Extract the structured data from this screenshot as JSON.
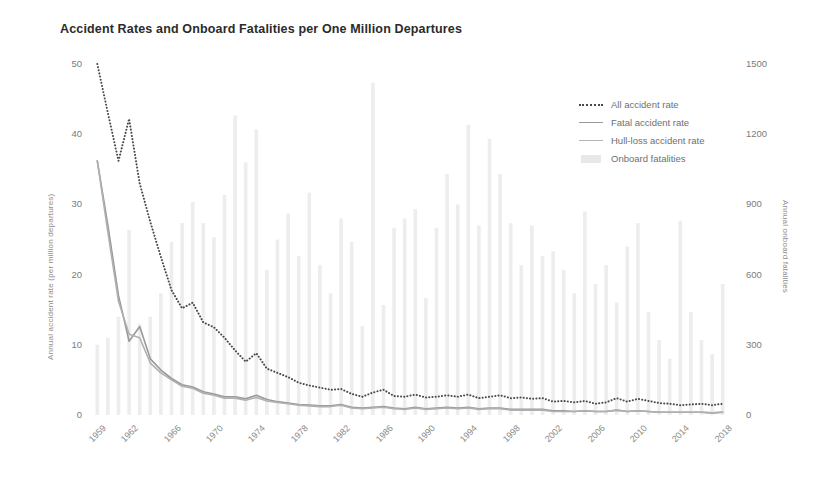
{
  "chart_data": {
    "type": "line",
    "title": "Accident Rates and Onboard Fatalities per One Million Departures",
    "xlabel": "",
    "ylabel": "Annual accident rate (per million departures)",
    "y2label": "Annual onboard fatalities",
    "ylim": [
      0,
      50
    ],
    "y2lim": [
      0,
      1500
    ],
    "yticks": [
      "0",
      "10",
      "20",
      "30",
      "40",
      "50"
    ],
    "ytick_values": [
      0,
      10,
      20,
      30,
      40,
      50
    ],
    "y2ticks": [
      "0",
      "300",
      "600",
      "900",
      "1200",
      "1500"
    ],
    "y2tick_values": [
      0,
      300,
      600,
      900,
      1200,
      1500
    ],
    "grid": false,
    "legend_position": "upper right",
    "xtick_labels": [
      "1959",
      "1962",
      "1966",
      "1970",
      "1974",
      "1978",
      "1982",
      "1986",
      "1990",
      "1994",
      "1998",
      "2002",
      "2006",
      "2010",
      "2014",
      "2018"
    ],
    "xtick_values": [
      1959,
      1962,
      1966,
      1970,
      1974,
      1978,
      1982,
      1986,
      1990,
      1994,
      1998,
      2002,
      2006,
      2010,
      2014,
      2018
    ],
    "x": [
      1959,
      1960,
      1961,
      1962,
      1963,
      1964,
      1965,
      1966,
      1967,
      1968,
      1969,
      1970,
      1971,
      1972,
      1973,
      1974,
      1975,
      1976,
      1977,
      1978,
      1979,
      1980,
      1981,
      1982,
      1983,
      1984,
      1985,
      1986,
      1987,
      1988,
      1989,
      1990,
      1991,
      1992,
      1993,
      1994,
      1995,
      1996,
      1997,
      1998,
      1999,
      2000,
      2001,
      2002,
      2003,
      2004,
      2005,
      2006,
      2007,
      2008,
      2009,
      2010,
      2011,
      2012,
      2013,
      2014,
      2015,
      2016,
      2017,
      2018
    ],
    "series": [
      {
        "name": "All accident rate",
        "axis": "left",
        "style": "dotted",
        "color": "#4a4a4a",
        "values": [
          50.0,
          43.0,
          36.2,
          42.2,
          33.0,
          27.5,
          22.5,
          17.8,
          15.2,
          16.0,
          13.2,
          12.5,
          11.0,
          9.2,
          7.6,
          8.8,
          6.6,
          6.0,
          5.4,
          4.6,
          4.2,
          3.9,
          3.6,
          3.7,
          3.0,
          2.6,
          3.2,
          3.6,
          2.7,
          2.6,
          2.9,
          2.5,
          2.6,
          2.8,
          2.6,
          2.9,
          2.4,
          2.6,
          2.8,
          2.4,
          2.5,
          2.3,
          2.4,
          1.9,
          2.0,
          1.8,
          2.0,
          1.6,
          1.8,
          2.4,
          1.9,
          2.3,
          2.0,
          1.7,
          1.6,
          1.4,
          1.5,
          1.6,
          1.4,
          1.6
        ]
      },
      {
        "name": "Fatal accident rate",
        "axis": "left",
        "style": "solid",
        "color": "#999999",
        "values": [
          36.2,
          27.0,
          17.0,
          10.5,
          12.6,
          8.0,
          6.4,
          5.2,
          4.3,
          4.0,
          3.3,
          3.0,
          2.6,
          2.6,
          2.3,
          2.8,
          2.2,
          1.9,
          1.7,
          1.5,
          1.4,
          1.3,
          1.3,
          1.5,
          1.1,
          1.0,
          1.1,
          1.2,
          1.0,
          0.9,
          1.1,
          0.9,
          1.0,
          1.1,
          1.0,
          1.1,
          0.9,
          1.0,
          1.0,
          0.8,
          0.8,
          0.8,
          0.8,
          0.6,
          0.6,
          0.5,
          0.6,
          0.5,
          0.5,
          0.7,
          0.5,
          0.6,
          0.5,
          0.4,
          0.4,
          0.4,
          0.4,
          0.4,
          0.3,
          0.4
        ]
      },
      {
        "name": "Hull-loss accident rate",
        "axis": "left",
        "style": "solid",
        "color": "#b0b0b0",
        "values": [
          36.2,
          26.0,
          16.2,
          11.5,
          11.0,
          7.4,
          6.0,
          5.0,
          4.1,
          3.8,
          3.1,
          2.8,
          2.4,
          2.4,
          2.1,
          2.5,
          2.0,
          1.8,
          1.6,
          1.4,
          1.3,
          1.2,
          1.2,
          1.4,
          1.0,
          0.9,
          1.0,
          1.1,
          0.9,
          0.8,
          1.0,
          0.8,
          0.9,
          1.0,
          0.9,
          1.0,
          0.8,
          0.9,
          0.9,
          0.7,
          0.7,
          0.7,
          0.7,
          0.5,
          0.5,
          0.5,
          0.6,
          0.5,
          0.5,
          0.7,
          0.5,
          0.6,
          0.5,
          0.4,
          0.4,
          0.4,
          0.4,
          0.4,
          0.3,
          0.4
        ]
      },
      {
        "name": "Onboard fatalities",
        "axis": "right",
        "style": "bar",
        "color": "#ededed",
        "values": [
          300,
          330,
          420,
          790,
          390,
          420,
          520,
          740,
          820,
          910,
          820,
          760,
          940,
          1280,
          1080,
          1220,
          620,
          750,
          860,
          680,
          950,
          640,
          520,
          840,
          740,
          380,
          1420,
          470,
          800,
          840,
          880,
          500,
          800,
          1030,
          900,
          1240,
          810,
          1180,
          1030,
          820,
          640,
          810,
          680,
          700,
          620,
          520,
          870,
          560,
          640,
          480,
          720,
          820,
          440,
          320,
          240,
          830,
          440,
          320,
          260,
          560
        ]
      }
    ]
  },
  "legend": {
    "items": [
      {
        "label": "All accident rate",
        "marker": "dotted-line",
        "color": "#4a4a4a"
      },
      {
        "label": "Fatal accident rate",
        "marker": "solid-line",
        "color": "#9a9a9a"
      },
      {
        "label": "Hull-loss accident rate",
        "marker": "solid-line",
        "color": "#b4b4b4"
      },
      {
        "label": "Onboard fatalities",
        "marker": "bar-swatch",
        "color": "#e8e8e8"
      }
    ]
  },
  "colors": {
    "background": "#ffffff",
    "title": "#2b2b2b",
    "tick_label": "#7b7b7b",
    "axis_title": "#8d8d8d",
    "all_accident_rate": "#4a4a4a",
    "fatal_accident_rate": "#999999",
    "hull_loss_accident_rate": "#b0b0b0",
    "onboard_fatalities_bar": "#ededed"
  }
}
